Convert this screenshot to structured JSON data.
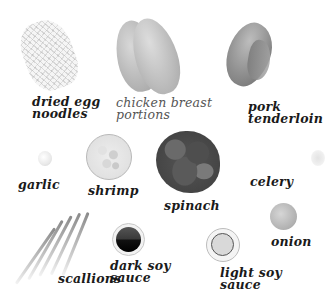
{
  "ingredients": {
    "noodles": {
      "label": "dried egg\nnoodles"
    },
    "chicken": {
      "label": "chicken breast\nportions"
    },
    "pork": {
      "label": "pork\ntenderloin"
    },
    "garlic": {
      "label": "garlic"
    },
    "shrimp": {
      "label": "shrimp"
    },
    "spinach": {
      "label": "spinach"
    },
    "celery": {
      "label": "celery"
    },
    "onion": {
      "label": "onion"
    },
    "scallions": {
      "label": "scallions"
    },
    "dark_soy": {
      "label": "dark soy\nsauce"
    },
    "light_soy": {
      "label": "light soy\nsauce"
    }
  }
}
